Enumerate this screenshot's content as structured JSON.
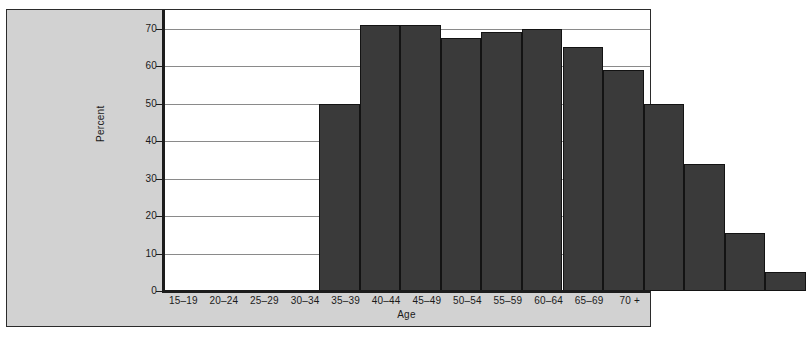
{
  "figure": {
    "background_color": "#d2d2d2",
    "plot_background_color": "#ffffff",
    "border_color": "#2b2b2b",
    "cropped_header_text": ""
  },
  "chart_data": {
    "type": "bar",
    "title": "",
    "subtitle": "",
    "xlabel": "Age",
    "ylabel": "Percent",
    "categories": [
      "15–19",
      "20–24",
      "25–29",
      "30–34",
      "35–39",
      "40–44",
      "45–49",
      "50–54",
      "55–59",
      "60–64",
      "65–69",
      "70 +"
    ],
    "values": [
      50,
      71,
      71,
      67.5,
      69,
      70,
      65,
      59,
      50,
      34,
      15.5,
      5
    ],
    "series": [
      {
        "name": "Percent",
        "values": [
          50,
          71,
          71,
          67.5,
          69,
          70,
          65,
          59,
          50,
          34,
          15.5,
          5
        ],
        "color": "#3a3a3a"
      }
    ],
    "ylim": [
      0,
      75
    ],
    "yticks": [
      0,
      10,
      20,
      30,
      40,
      50,
      60,
      70
    ],
    "ytick_labels": [
      "0",
      "10",
      "20",
      "30",
      "40",
      "50",
      "60",
      "70"
    ],
    "grid": true,
    "grid_axis": "y",
    "legend": false,
    "legend_position": "none",
    "bar_color": "#3a3a3a",
    "bar_edge_color": "#131313",
    "bar_gap": 0
  }
}
